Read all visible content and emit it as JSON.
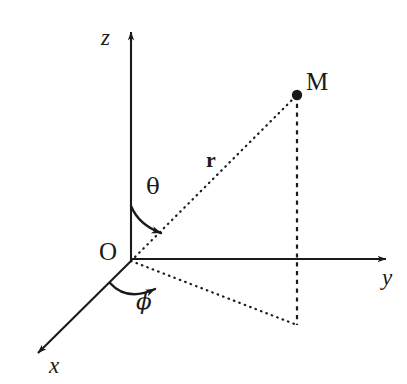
{
  "figure": {
    "background_color": "#ffffff",
    "stroke_color": "#1a1a1a",
    "width": 407,
    "height": 384
  },
  "axes": [
    {
      "id": "z",
      "label": "z",
      "style": "solid",
      "from": [
        131,
        261
      ],
      "to": [
        131,
        26
      ],
      "arrow": true
    },
    {
      "id": "y",
      "label": "y",
      "style": "solid",
      "from": [
        131,
        259
      ],
      "to": [
        392,
        259
      ],
      "arrow": true
    },
    {
      "id": "x",
      "label": "x",
      "style": "solid",
      "from": [
        131,
        261
      ],
      "to": [
        33,
        358
      ],
      "arrow": true
    }
  ],
  "origin": {
    "label": "O",
    "position": [
      131,
      261
    ]
  },
  "point": {
    "label": "M",
    "position": [
      297,
      95
    ],
    "dot_radius": 5
  },
  "projection_point": {
    "label": "",
    "position": [
      297,
      325
    ]
  },
  "segments": [
    {
      "id": "radius",
      "label": "r",
      "style": "dotted",
      "from": [
        131,
        261
      ],
      "to": [
        297,
        95
      ]
    },
    {
      "id": "vertical-drop",
      "label": "",
      "style": "dashed",
      "from": [
        297,
        95
      ],
      "to": [
        297,
        325
      ]
    },
    {
      "id": "ground-projection",
      "label": "",
      "style": "dotted",
      "from": [
        131,
        261
      ],
      "to": [
        297,
        325
      ]
    }
  ],
  "angles": [
    {
      "id": "theta",
      "label": "θ",
      "description": "polar angle from z-axis to radius",
      "vertex": [
        131,
        261
      ],
      "arrow": true
    },
    {
      "id": "phi",
      "label": "ϕ",
      "description": "azimuthal angle from x-axis to ground projection",
      "vertex": [
        131,
        261
      ],
      "arrow": true
    }
  ]
}
